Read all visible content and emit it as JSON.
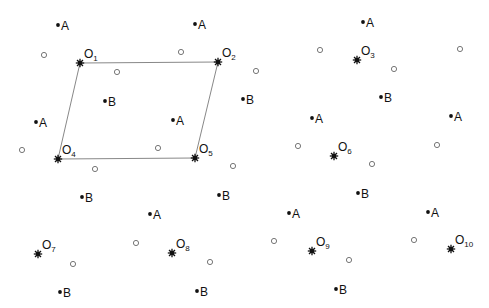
{
  "diagram": {
    "colors": {
      "ink": "#111111",
      "line": "#888888",
      "open_circle": "#777777",
      "background": "#ffffff"
    },
    "parallelogram": [
      "O1",
      "O2",
      "O5",
      "O4"
    ],
    "centers": [
      {
        "id": "O1",
        "base": "O",
        "sub": "1",
        "x": 80,
        "y": 63
      },
      {
        "id": "O2",
        "base": "O",
        "sub": "2",
        "x": 218,
        "y": 62
      },
      {
        "id": "O3",
        "base": "O",
        "sub": "3",
        "x": 357,
        "y": 60
      },
      {
        "id": "O4",
        "base": "O",
        "sub": "4",
        "x": 58,
        "y": 159
      },
      {
        "id": "O5",
        "base": "O",
        "sub": "5",
        "x": 195,
        "y": 158
      },
      {
        "id": "O6",
        "base": "O",
        "sub": "6",
        "x": 334,
        "y": 156
      },
      {
        "id": "O7",
        "base": "O",
        "sub": "7",
        "x": 38,
        "y": 254
      },
      {
        "id": "O8",
        "base": "O",
        "sub": "8",
        "x": 172,
        "y": 253
      },
      {
        "id": "O9",
        "base": "O",
        "sub": "9",
        "x": 312,
        "y": 251
      },
      {
        "id": "O10",
        "base": "O",
        "sub": "10",
        "x": 451,
        "y": 249
      }
    ],
    "points_A": [
      {
        "label": "A",
        "x": 58,
        "y": 25
      },
      {
        "label": "A",
        "x": 195,
        "y": 24
      },
      {
        "label": "A",
        "x": 363,
        "y": 22
      },
      {
        "label": "A",
        "x": 36,
        "y": 122
      },
      {
        "label": "A",
        "x": 173,
        "y": 120
      },
      {
        "label": "A",
        "x": 312,
        "y": 118
      },
      {
        "label": "A",
        "x": 451,
        "y": 116
      },
      {
        "label": "A",
        "x": 150,
        "y": 214
      },
      {
        "label": "A",
        "x": 289,
        "y": 213
      },
      {
        "label": "A",
        "x": 428,
        "y": 212
      }
    ],
    "points_B": [
      {
        "label": "B",
        "x": 105,
        "y": 101
      },
      {
        "label": "B",
        "x": 243,
        "y": 99
      },
      {
        "label": "B",
        "x": 381,
        "y": 97
      },
      {
        "label": "B",
        "x": 82,
        "y": 197
      },
      {
        "label": "B",
        "x": 219,
        "y": 195
      },
      {
        "label": "B",
        "x": 358,
        "y": 193
      },
      {
        "label": "B",
        "x": 60,
        "y": 292
      },
      {
        "label": "B",
        "x": 197,
        "y": 291
      },
      {
        "label": "B",
        "x": 336,
        "y": 289
      }
    ],
    "open_circles": [
      {
        "x": 44,
        "y": 55
      },
      {
        "x": 117,
        "y": 72
      },
      {
        "x": 181,
        "y": 52
      },
      {
        "x": 256,
        "y": 71
      },
      {
        "x": 320,
        "y": 50
      },
      {
        "x": 394,
        "y": 69
      },
      {
        "x": 460,
        "y": 49
      },
      {
        "x": 22,
        "y": 150
      },
      {
        "x": 158,
        "y": 148
      },
      {
        "x": 95,
        "y": 169
      },
      {
        "x": 233,
        "y": 166
      },
      {
        "x": 298,
        "y": 146
      },
      {
        "x": 372,
        "y": 164
      },
      {
        "x": 437,
        "y": 145
      },
      {
        "x": 136,
        "y": 243
      },
      {
        "x": 73,
        "y": 264
      },
      {
        "x": 210,
        "y": 262
      },
      {
        "x": 274,
        "y": 241
      },
      {
        "x": 349,
        "y": 260
      },
      {
        "x": 414,
        "y": 240
      }
    ]
  }
}
